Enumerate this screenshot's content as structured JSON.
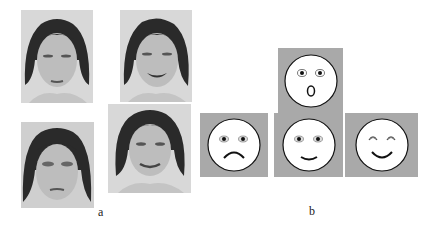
{
  "figure": {
    "panel_a": {
      "label": "a",
      "photos": [
        {
          "expression": "neutral"
        },
        {
          "expression": "happy"
        },
        {
          "expression": "sad"
        },
        {
          "expression": "smiling"
        }
      ]
    },
    "panel_b": {
      "label": "b",
      "emoticons": [
        {
          "expression": "surprised"
        },
        {
          "expression": "sad"
        },
        {
          "expression": "neutral-happy"
        },
        {
          "expression": "very-happy"
        }
      ]
    },
    "colors": {
      "panel_bg": "#a9a9a9",
      "face_fill": "#ffffff",
      "stroke": "#111111"
    }
  }
}
